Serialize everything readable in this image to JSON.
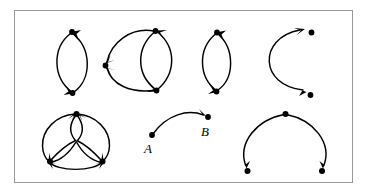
{
  "figure": {
    "background_color": "#ffffff",
    "frame": {
      "name": "figure-border",
      "stroke_color": "#999999",
      "x": 14,
      "y": 10,
      "width": 339,
      "height": 173
    },
    "stroke_color": "#000000",
    "node_color": "#000000",
    "labels": [
      {
        "text": "A",
        "x": 151,
        "y": 152
      },
      {
        "text": "B",
        "x": 205,
        "y": 135
      }
    ],
    "diagrams": [
      {
        "name": "bigon-two-node-top-left",
        "description": "Lens with two vertices joined by two arcs, arrows at both vertices",
        "nodes": [
          {
            "x": 72,
            "y": 32
          },
          {
            "x": 72,
            "y": 93
          }
        ],
        "arcs": [
          {
            "d": "M 72 93 C 52 78 52 48 70 33",
            "arrow_at": "end",
            "arrow_angle": -42
          },
          {
            "d": "M 72 32 C 92 48 92 78 74 92",
            "arrow_at": "end",
            "arrow_angle": 132
          }
        ]
      },
      {
        "name": "three-node-double-lens-top",
        "description": "Three vertices: left vertex receives two arcs, inner lens between the two right vertices",
        "nodes": [
          {
            "x": 105,
            "y": 65
          },
          {
            "x": 155,
            "y": 31
          },
          {
            "x": 157,
            "y": 90
          }
        ],
        "arcs": [
          {
            "d": "M 155 31 C 128 30 110 46 106 62",
            "arrow_at": "end",
            "arrow_angle": 105
          },
          {
            "d": "M 157 90 C 128 92 110 82 106 68",
            "arrow_at": "end",
            "arrow_angle": 252
          },
          {
            "d": "M 155 31 C 136 48 136 74 155 89",
            "arrow_at": "end",
            "arrow_angle": 50
          },
          {
            "d": "M 157 90 C 176 74 176 48 157 32",
            "arrow_at": "end",
            "arrow_angle": -50
          }
        ]
      },
      {
        "name": "bigon-two-node-top-right",
        "description": "Lens with two vertices joined by two arcs, arrows at both vertices",
        "nodes": [
          {
            "x": 217,
            "y": 33
          },
          {
            "x": 216,
            "y": 91
          }
        ],
        "arcs": [
          {
            "d": "M 216 91 C 198 77 198 49 215 34",
            "arrow_at": "end",
            "arrow_angle": -42
          },
          {
            "d": "M 217 33 C 235 49 235 77 218 90",
            "arrow_at": "end",
            "arrow_angle": 132
          }
        ]
      },
      {
        "name": "c-shape-open-arc-top-right",
        "description": "Open C-shaped arc with arrowheads at both right-hand endpoints",
        "nodes": [
          {
            "x": 312,
            "y": 33
          },
          {
            "x": 311,
            "y": 95
          }
        ],
        "arcs": [
          {
            "d": "M 300 88 C 258 84 256 38 298 30",
            "arrow_at": "both",
            "arrow_angle": -20
          }
        ]
      },
      {
        "name": "trefoil-three-node-bottom-left",
        "description": "Three vertices on a circle with three inner petal arcs through the centre and outer arcs",
        "nodes": [
          {
            "x": 76,
            "y": 114
          },
          {
            "x": 50,
            "y": 161
          },
          {
            "x": 102,
            "y": 161
          }
        ],
        "arcs": []
      },
      {
        "name": "single-arc-a-to-b",
        "description": "Single arc from vertex A to vertex B with one arrowhead at B",
        "nodes": [
          {
            "x": 152,
            "y": 135
          },
          {
            "x": 208,
            "y": 117
          }
        ],
        "arcs": [
          {
            "d": "M 152 135 C 168 113 190 110 205 116",
            "arrow_at": "end",
            "arrow_angle": 20
          }
        ]
      },
      {
        "name": "arch-three-node-bottom-right",
        "description": "Arch with apex vertex and two arcs descending to lower vertices, arrowheads at the bottom",
        "nodes": [
          {
            "x": 285,
            "y": 114
          },
          {
            "x": 247,
            "y": 171
          },
          {
            "x": 322,
            "y": 171
          }
        ],
        "arcs": [
          {
            "d": "M 285 114 C 256 120 238 144 245 166",
            "arrow_at": "end",
            "arrow_angle": 73
          },
          {
            "d": "M 285 114 C 314 120 332 144 324 166",
            "arrow_at": "end",
            "arrow_angle": 107
          }
        ]
      }
    ]
  }
}
